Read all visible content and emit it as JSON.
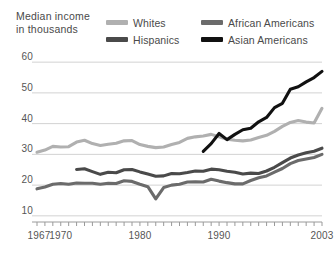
{
  "title": "Median income\nin thousands",
  "legend": [
    {
      "label": "Whites",
      "color": "#b0b0b0",
      "key": "whites"
    },
    {
      "label": "African Americans",
      "color": "#6b6b6b",
      "key": "african_americans"
    },
    {
      "label": "Hispanics",
      "color": "#4a4a4a",
      "key": "hispanics"
    },
    {
      "label": "Asian Americans",
      "color": "#111111",
      "key": "asian_americans"
    }
  ],
  "chart_data": {
    "type": "line",
    "title": "Median income in thousands",
    "xlabel": "",
    "ylabel": "Median income in thousands",
    "xlim": [
      1967,
      2003
    ],
    "ylim": [
      8,
      62
    ],
    "yticks": [
      10,
      20,
      30,
      40,
      50,
      60
    ],
    "ytick_labels": [
      "10",
      "20",
      "30",
      "40",
      "50",
      "60"
    ],
    "xticks": [
      1967,
      1970,
      1980,
      1990,
      2003
    ],
    "xtick_labels": [
      "1967",
      "1970",
      "1980",
      "1990",
      "2003"
    ],
    "grid": "horizontal",
    "legend_position": "top",
    "series": [
      {
        "name": "Whites",
        "color": "#b0b0b0",
        "x": [
          1967,
          1968,
          1969,
          1970,
          1971,
          1972,
          1973,
          1974,
          1975,
          1976,
          1977,
          1978,
          1979,
          1980,
          1981,
          1982,
          1983,
          1984,
          1985,
          1986,
          1987,
          1988,
          1989,
          1990,
          1991,
          1992,
          1993,
          1994,
          1995,
          1996,
          1997,
          1998,
          1999,
          2000,
          2001,
          2002,
          2003
        ],
        "values": [
          30.7,
          31.4,
          32.6,
          32.4,
          32.5,
          34.0,
          34.6,
          33.5,
          32.9,
          33.3,
          33.6,
          34.4,
          34.5,
          33.2,
          32.6,
          32.2,
          32.4,
          33.2,
          33.9,
          35.2,
          35.7,
          36.0,
          36.5,
          35.7,
          34.9,
          34.6,
          34.4,
          34.7,
          35.5,
          36.2,
          37.5,
          39.1,
          40.4,
          41.0,
          40.5,
          40.2,
          45.0
        ]
      },
      {
        "name": "African Americans",
        "color": "#6b6b6b",
        "x": [
          1967,
          1968,
          1969,
          1970,
          1971,
          1972,
          1973,
          1974,
          1975,
          1976,
          1977,
          1978,
          1979,
          1980,
          1981,
          1982,
          1983,
          1984,
          1985,
          1986,
          1987,
          1988,
          1989,
          1990,
          1991,
          1992,
          1993,
          1994,
          1995,
          1996,
          1997,
          1998,
          1999,
          2000,
          2001,
          2002,
          2003
        ],
        "values": [
          18.8,
          19.4,
          20.3,
          20.5,
          20.3,
          20.7,
          20.6,
          20.6,
          20.3,
          20.6,
          20.5,
          21.4,
          21.2,
          20.3,
          19.5,
          15.5,
          19.2,
          20.0,
          20.3,
          21.0,
          21.1,
          21.0,
          21.9,
          21.3,
          20.8,
          20.4,
          20.4,
          21.5,
          22.4,
          23.0,
          24.2,
          25.4,
          27.0,
          28.0,
          28.5,
          29.0,
          30.0
        ]
      },
      {
        "name": "Hispanics",
        "color": "#4a4a4a",
        "x": [
          1972,
          1973,
          1974,
          1975,
          1976,
          1977,
          1978,
          1979,
          1980,
          1981,
          1982,
          1983,
          1984,
          1985,
          1986,
          1987,
          1988,
          1989,
          1990,
          1991,
          1992,
          1993,
          1994,
          1995,
          1996,
          1997,
          1998,
          1999,
          2000,
          2001,
          2002,
          2003
        ],
        "values": [
          25.1,
          25.3,
          24.4,
          23.5,
          24.2,
          24.0,
          25.0,
          25.1,
          24.3,
          23.6,
          22.9,
          23.0,
          23.8,
          23.7,
          24.1,
          24.6,
          24.5,
          25.2,
          25.0,
          24.5,
          24.2,
          23.6,
          23.9,
          23.8,
          24.6,
          25.8,
          27.3,
          28.8,
          29.8,
          30.5,
          31.0,
          32.0
        ]
      },
      {
        "name": "Asian Americans",
        "color": "#111111",
        "x": [
          1988,
          1989,
          1990,
          1991,
          1992,
          1993,
          1994,
          1995,
          1996,
          1997,
          1998,
          1999,
          2000,
          2001,
          2002,
          2003
        ],
        "values": [
          31.0,
          33.5,
          36.8,
          34.8,
          36.5,
          38.0,
          38.5,
          40.6,
          42.0,
          45.2,
          46.6,
          51.2,
          52.0,
          53.6,
          55.0,
          57.0
        ]
      }
    ]
  }
}
